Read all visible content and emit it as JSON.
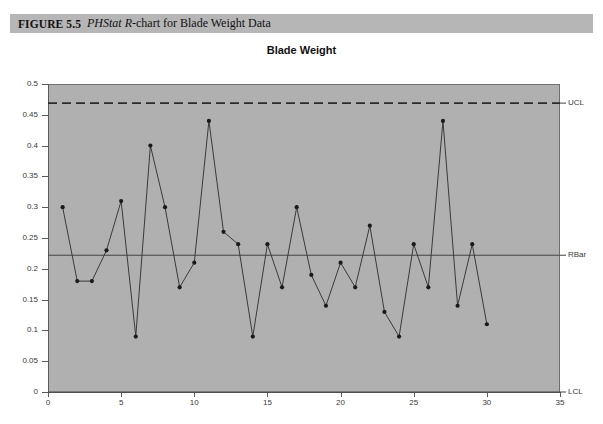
{
  "figure": {
    "label": "FIGURE 5.5",
    "caption_prefix": "PHStat",
    "caption_rest": "-chart for Blade Weight Data",
    "caption_italic_mid": "R",
    "caption_full": "FIGURE 5.5  PHStat R-chart for Blade Weight Data"
  },
  "colors": {
    "caption_bar": "#b6b6b6",
    "plot_background": "#b0b0b0",
    "axis": "#5a5a5a",
    "series_line": "#3a3a3a",
    "marker": "#1a1a1a",
    "center_line": "#444444",
    "ucl_line": "#2b2b2b"
  },
  "chart_data": {
    "type": "line",
    "title": "Blade Weight",
    "xlabel": "",
    "ylabel": "",
    "xlim": [
      0,
      35
    ],
    "ylim": [
      0,
      0.5
    ],
    "xticks": [
      0,
      5,
      10,
      15,
      20,
      25,
      30,
      35
    ],
    "xtick_labels": [
      "0",
      "5",
      "10",
      "15",
      "20",
      "25",
      "30",
      "35"
    ],
    "yticks": [
      0,
      0.05,
      0.1,
      0.15,
      0.2,
      0.25,
      0.3,
      0.35,
      0.4,
      0.45,
      0.5
    ],
    "ytick_labels": [
      "0",
      "0.05",
      "0.1",
      "0.15",
      "0.2",
      "0.25",
      "0.3",
      "0.35",
      "0.4",
      "0.45",
      "0.5"
    ],
    "grid": false,
    "legend_position": "right-inline",
    "x": [
      1,
      2,
      3,
      4,
      5,
      6,
      7,
      8,
      9,
      10,
      11,
      12,
      13,
      14,
      15,
      16,
      17,
      18,
      19,
      20,
      21,
      22,
      23,
      24,
      25,
      26,
      27,
      28,
      29,
      30
    ],
    "series": [
      {
        "name": "Range",
        "values": [
          0.3,
          0.18,
          0.18,
          0.23,
          0.31,
          0.09,
          0.4,
          0.3,
          0.17,
          0.21,
          0.44,
          0.26,
          0.24,
          0.09,
          0.24,
          0.17,
          0.3,
          0.19,
          0.14,
          0.21,
          0.17,
          0.27,
          0.13,
          0.09,
          0.24,
          0.17,
          0.44,
          0.14,
          0.24,
          0.11
        ]
      }
    ],
    "control_limits": [
      {
        "name": "UCL",
        "label": "UCL",
        "value": 0.469,
        "style": "dashed"
      },
      {
        "name": "RBar",
        "label": "RBar",
        "value": 0.222,
        "style": "solid"
      },
      {
        "name": "LCL",
        "label": "LCL",
        "value": 0.0,
        "style": "solid"
      }
    ]
  }
}
